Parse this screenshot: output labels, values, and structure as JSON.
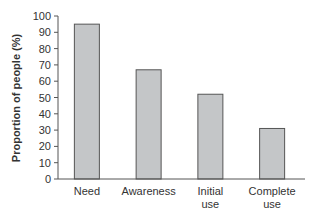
{
  "chart_data": {
    "type": "bar",
    "title": "",
    "xlabel": "",
    "ylabel": "Proportion of people (%)",
    "categories": [
      "Need",
      "Awareness",
      "Initial use",
      "Complete use"
    ],
    "category_lines": [
      [
        "Need"
      ],
      [
        "Awareness"
      ],
      [
        "Initial",
        "use"
      ],
      [
        "Complete",
        "use"
      ]
    ],
    "values": [
      95,
      67,
      52,
      31
    ],
    "ylim": [
      0,
      100
    ],
    "yticks": [
      0,
      10,
      20,
      30,
      40,
      50,
      60,
      70,
      80,
      90,
      100
    ],
    "grid": false,
    "legend": null,
    "bar_color": "#c4c6c8",
    "bar_edge_color": "#555555"
  }
}
